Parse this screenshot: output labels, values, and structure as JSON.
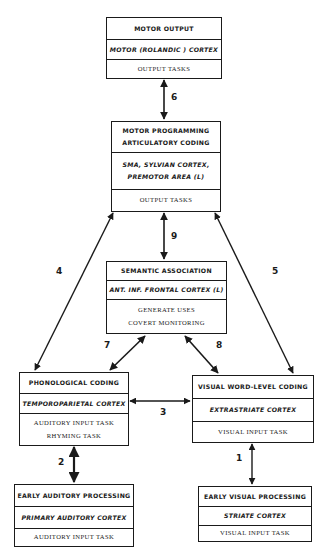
{
  "diagram": {
    "boxes": {
      "motor_output": {
        "title": "MOTOR OUTPUT",
        "region": "MOTOR (ROLANDIC ) CORTEX",
        "tasks": [
          "OUTPUT TASKS"
        ]
      },
      "motor_programming": {
        "title_lines": [
          "MOTOR PROGRAMMING",
          "ARTICULATORY CODING"
        ],
        "region_lines": [
          "SMA, SYLVIAN CORTEX,",
          "PREMOTOR AREA (L)"
        ],
        "tasks": [
          "OUTPUT TASKS"
        ]
      },
      "semantic_association": {
        "title": "SEMANTIC ASSOCIATION",
        "region": "ANT. INF. FRONTAL CORTEX (L)",
        "tasks": [
          "GENERATE USES",
          "COVERT MONITORING"
        ]
      },
      "phonological_coding": {
        "title": "PHONOLOGICAL CODING",
        "region": "TEMPOROPARIETAL CORTEX",
        "tasks": [
          "AUDITORY INPUT TASK",
          "RHYMING TASK"
        ]
      },
      "visual_word_level": {
        "title": "VISUAL WORD-LEVEL CODING",
        "region": "EXTRASTRIATE CORTEX",
        "tasks": [
          "VISUAL INPUT TASK"
        ]
      },
      "early_auditory": {
        "title": "EARLY AUDITORY PROCESSING",
        "region": "PRIMARY AUDITORY CORTEX",
        "tasks": [
          "AUDITORY INPUT TASK"
        ]
      },
      "early_visual": {
        "title": "EARLY VISUAL PROCESSING",
        "region": "STRIATE CORTEX",
        "tasks": [
          "VISUAL INPUT TASK"
        ]
      }
    },
    "connections": [
      {
        "id": "1",
        "label": "1",
        "from": "early_visual",
        "to": "visual_word_level"
      },
      {
        "id": "2",
        "label": "2",
        "from": "early_auditory",
        "to": "phonological_coding"
      },
      {
        "id": "3",
        "label": "3",
        "from": "phonological_coding",
        "to": "visual_word_level"
      },
      {
        "id": "4",
        "label": "4",
        "from": "phonological_coding",
        "to": "motor_programming"
      },
      {
        "id": "5",
        "label": "5",
        "from": "visual_word_level",
        "to": "motor_programming"
      },
      {
        "id": "6",
        "label": "6",
        "from": "motor_programming",
        "to": "motor_output"
      },
      {
        "id": "7",
        "label": "7",
        "from": "phonological_coding",
        "to": "semantic_association"
      },
      {
        "id": "8",
        "label": "8",
        "from": "visual_word_level",
        "to": "semantic_association"
      },
      {
        "id": "9",
        "label": "9",
        "from": "semantic_association",
        "to": "motor_programming"
      }
    ]
  }
}
